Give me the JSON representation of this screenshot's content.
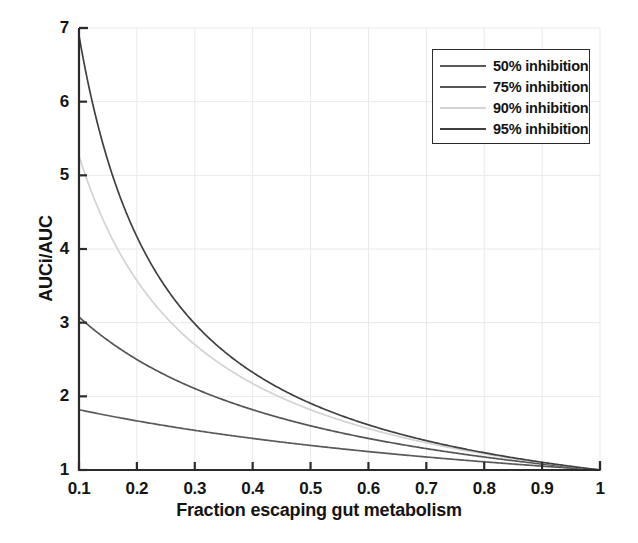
{
  "chart_data": {
    "type": "line",
    "title": "",
    "xlabel": "Fraction escaping gut metabolism",
    "ylabel": "AUCi/AUC",
    "xlim": [
      0.1,
      1.0
    ],
    "ylim": [
      1,
      7
    ],
    "xticks": [
      "0.1",
      "0.2",
      "0.3",
      "0.4",
      "0.5",
      "0.6",
      "0.7",
      "0.8",
      "0.9",
      "1"
    ],
    "xtick_values": [
      0.1,
      0.2,
      0.3,
      0.4,
      0.5,
      0.6,
      0.7,
      0.8,
      0.9,
      1.0
    ],
    "yticks": [
      "1",
      "2",
      "3",
      "4",
      "5",
      "6",
      "7"
    ],
    "ytick_values": [
      1,
      2,
      3,
      4,
      5,
      6,
      7
    ],
    "grid": true,
    "legend_position": "upper right",
    "x": [
      0.1,
      0.15,
      0.2,
      0.25,
      0.3,
      0.35,
      0.4,
      0.45,
      0.5,
      0.55,
      0.6,
      0.65,
      0.7,
      0.75,
      0.8,
      0.85,
      0.9,
      0.95,
      1.0
    ],
    "series": [
      {
        "name": "50% inhibition",
        "inhibition": 0.5,
        "color": "#5a5a5a",
        "values": [
          1.82,
          1.74,
          1.67,
          1.6,
          1.54,
          1.48,
          1.43,
          1.38,
          1.33,
          1.29,
          1.25,
          1.21,
          1.18,
          1.14,
          1.11,
          1.08,
          1.05,
          1.03,
          1.0
        ]
      },
      {
        "name": "75% inhibition",
        "inhibition": 0.75,
        "color": "#555555",
        "values": [
          3.08,
          2.76,
          2.5,
          2.29,
          2.11,
          1.96,
          1.82,
          1.71,
          1.6,
          1.51,
          1.43,
          1.36,
          1.29,
          1.23,
          1.18,
          1.13,
          1.08,
          1.04,
          1.0
        ]
      },
      {
        "name": "90% inhibition",
        "inhibition": 0.9,
        "color": "#d3d3d3",
        "values": [
          5.26,
          4.44,
          3.85,
          3.39,
          3.03,
          2.74,
          2.5,
          2.3,
          2.13,
          1.98,
          1.85,
          1.74,
          1.64,
          1.56,
          1.47,
          1.4,
          1.33,
          1.27,
          1.0
        ]
      },
      {
        "name": "95% inhibition",
        "inhibition": 0.95,
        "color": "#404040",
        "values": [
          6.9,
          5.6,
          4.71,
          4.08,
          3.6,
          3.23,
          2.91,
          2.67,
          2.45,
          2.27,
          2.11,
          1.98,
          1.85,
          1.74,
          1.65,
          1.56,
          1.48,
          1.41,
          1.0
        ]
      }
    ]
  },
  "axes": {
    "x_title": "Fraction escaping gut metabolism",
    "y_title": "AUCi/AUC",
    "x_tick_labels": [
      "0.1",
      "0.2",
      "0.3",
      "0.4",
      "0.5",
      "0.6",
      "0.7",
      "0.8",
      "0.9",
      "1"
    ],
    "y_tick_labels": [
      "7",
      "6",
      "5",
      "4",
      "3",
      "2",
      "1"
    ]
  },
  "legend": {
    "entries": [
      {
        "label": "50% inhibition",
        "color": "#5a5a5a"
      },
      {
        "label": "75% inhibition",
        "color": "#555555"
      },
      {
        "label": "90% inhibition",
        "color": "#d3d3d3"
      },
      {
        "label": "95% inhibition",
        "color": "#404040"
      }
    ]
  },
  "style": {
    "axis_color": "#2b2b2b",
    "grid_color": "#e9e9e9",
    "background": "#ffffff"
  }
}
